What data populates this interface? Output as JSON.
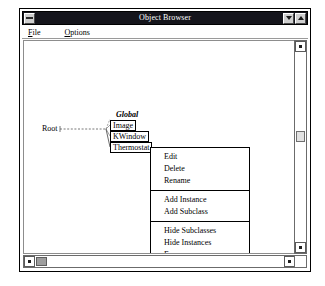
{
  "window": {
    "title": "Object Browser",
    "system_button_icon": "minimize-bar-icon",
    "minimize_button_icon": "triangle-down-icon",
    "maximize_button_icon": "triangle-up-icon"
  },
  "menubar": {
    "items": [
      {
        "label": "File",
        "accelerator": "F"
      },
      {
        "label": "Options",
        "accelerator": "O"
      }
    ]
  },
  "diagram": {
    "root_label": "Root",
    "group_label": "Global",
    "classes": [
      {
        "name": "Image"
      },
      {
        "name": "KWindow"
      },
      {
        "name": "Thermostat"
      }
    ]
  },
  "context_menu": {
    "groups": [
      {
        "items": [
          {
            "label": "Edit"
          },
          {
            "label": "Delete"
          },
          {
            "label": "Rename"
          }
        ]
      },
      {
        "items": [
          {
            "label": "Add Instance"
          },
          {
            "label": "Add Subclass"
          }
        ]
      },
      {
        "items": [
          {
            "label": "Hide Subclasses"
          },
          {
            "label": "Hide Instances"
          },
          {
            "label": "Focus"
          }
        ]
      }
    ]
  },
  "scrollbars": {
    "vertical": {
      "up_icon": "scroll-up-icon",
      "down_icon": "scroll-down-icon"
    },
    "horizontal": {
      "left_icon": "scroll-left-icon",
      "right_icon": "scroll-right-icon"
    }
  },
  "colors": {
    "titlebar_bg": "#15151c",
    "titlebar_fg": "#ffffff",
    "window_bg": "#ffffff",
    "border": "#000000",
    "scroll_thumb": "#9d9d9d"
  }
}
